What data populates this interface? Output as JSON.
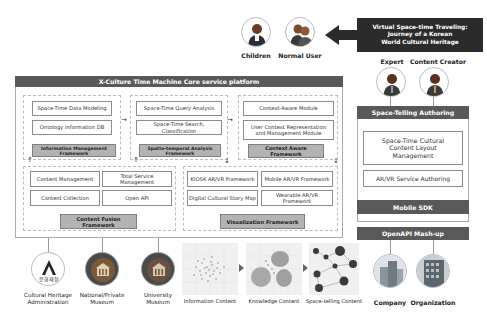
{
  "users": {
    "children": "Children",
    "normal_user": "Normal User",
    "expert": "Expert",
    "content_creator": "Content Creator"
  },
  "banner": {
    "line1": "Virtual Space-time Traveling:",
    "line2": "Journey of a Korean",
    "line3": "World Cultural Heritage"
  },
  "platform": {
    "title": "X-Culture Time Machine Core service platform",
    "info_mgmt": {
      "items": [
        "Space-Time Data Modeling",
        "Ontology Information DB"
      ],
      "framework": "Information Management Framework"
    },
    "spatio": {
      "items": [
        "Space-Time Query Analysis",
        "Space-Time Search, Classification"
      ],
      "framework": "Spatio-temporal Analysis Framework"
    },
    "context": {
      "items": [
        "Context-Aware Module",
        "User Context Representation and Management Module"
      ],
      "framework": "Context Aware Framework"
    },
    "fusion": {
      "items": [
        "Content Management",
        "Total Service Management",
        "Content Collection",
        "Open API"
      ],
      "framework": "Content Fusion Framework"
    },
    "visual": {
      "items": [
        "KIOSK AR/VR Framework",
        "Mobile AR/VR Framework",
        "Digital Cultural Story Map",
        "Wearable AR/VR Framework"
      ],
      "framework": "Visualization Framework"
    }
  },
  "authoring": {
    "title": "Space-Telling Authoring",
    "layout": "Space-Time Cultural Content Layout Management",
    "arvr": "AR/VR Service Authoring",
    "mobile_sdk": "Mobile SDK",
    "openapi": "OpenAPI Mash-up"
  },
  "sources": {
    "cha_line1": "Cultural Heritage",
    "cha_line2": "Administration",
    "cha_logo_text": "문화재청",
    "national_line1": "National/Private",
    "national_line2": "Museum",
    "univ_line1": "University",
    "univ_line2": "Museum"
  },
  "content_stages": [
    "Information Content",
    "Knowledge Content",
    "Space-telling Content"
  ],
  "partners": {
    "company": "Company",
    "organization": "Organization"
  }
}
